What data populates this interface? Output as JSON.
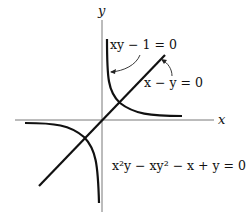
{
  "figure": {
    "axis_labels": {
      "x": "x",
      "y": "y"
    },
    "equations": {
      "hyperbola": "xy − 1 = 0",
      "line": "x − y = 0",
      "combined": "x²y − xy² − x + y = 0"
    },
    "curves": [
      {
        "name": "hyperbola-xy-1",
        "equation": "xy − 1 = 0",
        "branches": [
          "first-quadrant",
          "third-quadrant"
        ]
      },
      {
        "name": "line-x-minus-y",
        "equation": "x − y = 0"
      }
    ],
    "colors": {
      "curve": "#111111",
      "axis": "#555555",
      "background": "#ffffff"
    }
  }
}
